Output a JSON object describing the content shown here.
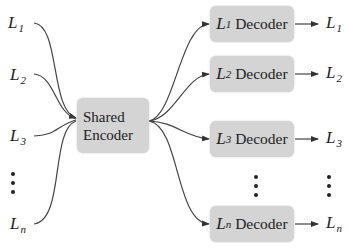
{
  "diagram": {
    "type": "shared-encoder multi-decoder",
    "inputs": [
      {
        "base": "L",
        "sub": "1"
      },
      {
        "base": "L",
        "sub": "2"
      },
      {
        "base": "L",
        "sub": "3"
      },
      {
        "base": "L",
        "sub": "n"
      }
    ],
    "encoder": {
      "line1": "Shared",
      "line2": "Encoder"
    },
    "decoders": [
      {
        "base": "L",
        "sub": "1",
        "label": "Decoder"
      },
      {
        "base": "L",
        "sub": "2",
        "label": "Decoder"
      },
      {
        "base": "L",
        "sub": "3",
        "label": "Decoder"
      },
      {
        "base": "L",
        "sub": "n",
        "label": "Decoder"
      }
    ],
    "outputs": [
      {
        "base": "L",
        "sub": "1"
      },
      {
        "base": "L",
        "sub": "2"
      },
      {
        "base": "L",
        "sub": "3"
      },
      {
        "base": "L",
        "sub": "n"
      }
    ],
    "colors": {
      "box_fill": "#d4d4d4",
      "line": "#333333",
      "text": "#222222"
    }
  }
}
